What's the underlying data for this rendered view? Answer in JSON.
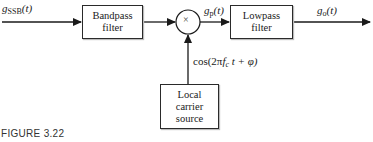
{
  "diagram": {
    "input_signal": {
      "base": "g",
      "sub": "SSB",
      "arg": "(t)"
    },
    "bandpass": {
      "line1": "Bandpass",
      "line2": "filter"
    },
    "multiplier": {
      "symbol": "×"
    },
    "product_signal": {
      "base": "g",
      "sub": "p",
      "arg": "(t)"
    },
    "lowpass": {
      "line1": "Lowpass",
      "line2": "filter"
    },
    "output_signal": {
      "base": "g",
      "sub": "o",
      "arg": "(t)"
    },
    "carrier_signal": {
      "pre": "cos(2π",
      "f": "f",
      "sub": "c",
      "post": "t + φ)"
    },
    "carrier_source": {
      "line1": "Local",
      "line2": "carrier",
      "line3": "source"
    },
    "colors": {
      "line": "#1a1a1a",
      "box_border": "#2a2a2a",
      "background": "#ffffff"
    }
  },
  "caption": "FIGURE 3.22"
}
